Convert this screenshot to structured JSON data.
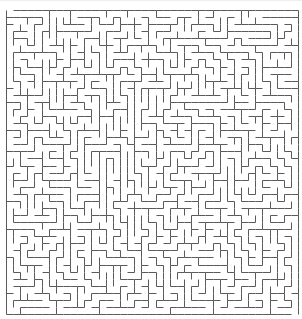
{
  "maze": {
    "cols": 41,
    "rows": 43,
    "origin_x": 6,
    "origin_y": 10,
    "width_px": 292,
    "height_px": 304,
    "wall_color": "#5a5a5a",
    "wall_width": 1,
    "background": "#ffffff",
    "seed": 20240611,
    "entrance": {
      "side": "top",
      "col": 0
    },
    "exit": {
      "side": "bottom",
      "col": 40
    }
  }
}
